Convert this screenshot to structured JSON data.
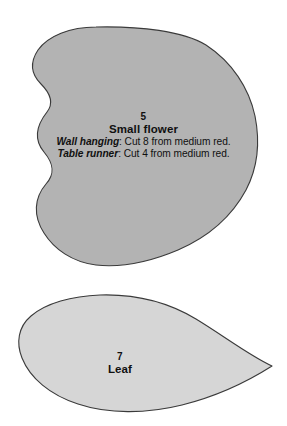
{
  "sheet": {
    "title": "Quilt pattern template sheet",
    "background_color": "#ffffff"
  },
  "pieces": [
    {
      "id": "small-flower",
      "number": "5",
      "name": "Small flower",
      "fill_color": "#b3b3b3",
      "outline_color": "#3a3a3a",
      "instructions": [
        {
          "context": "Wall hanging",
          "separator": ":",
          "text": " Cut 8 from medium red."
        },
        {
          "context": "Table runner",
          "separator": ":",
          "text": " Cut 4 from medium red."
        }
      ]
    },
    {
      "id": "leaf",
      "number": "7",
      "name": "Leaf",
      "fill_color": "#d6d6d6",
      "outline_color": "#3a3a3a",
      "instructions": []
    }
  ]
}
